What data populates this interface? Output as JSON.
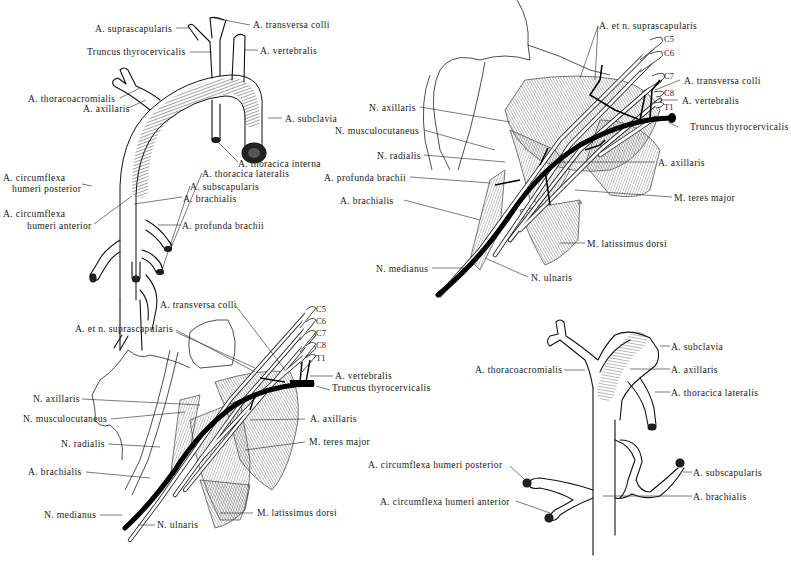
{
  "figures": {
    "fig_a": {
      "name": "arteria-subclavia-axillaris-schema",
      "labels": {
        "suprascapularis": "A. suprascapularis",
        "transversa_colli": "A. transversa colli",
        "truncus": "Truncus thyrocervicalis",
        "vertebralis": "A. vertebralis",
        "thoracoacromialis": "A. thoracoacromialis",
        "axillaris": "A. axillaris",
        "subclavia": "A. subclavia",
        "thoracica_interna": "A. thoracica interna",
        "thoracica_lateralis": "A. thoracica lateralis",
        "circ_post_1": "A. circumflexa",
        "circ_post_2": "humeri posterior",
        "subscapularis": "A. subscapularis",
        "circ_ant_1": "A. circumflexa",
        "circ_ant_2": "humeri anterior",
        "brachialis": "A. brachialis",
        "profunda": "A. profunda brachii"
      }
    },
    "fig_b": {
      "name": "plexus-brachialis-axilla-right",
      "labels": {
        "supra": "A. et n. suprascapularis",
        "c5": "C5",
        "c6": "C6",
        "c7": "C7",
        "c8": "C8",
        "t1": "T1",
        "transversa_colli": "A. transversa colli",
        "vertebralis": "A. vertebralis",
        "truncus": "Truncus thyrocervicalis",
        "n_axillaris": "N. axillaris",
        "n_musculo": "N. musculocutaneus",
        "n_radialis": "N. radialis",
        "profunda": "A. profunda brachii",
        "a_axillaris": "A. axillaris",
        "teres": "M. teres major",
        "brachialis": "A. brachialis",
        "latissimus": "M. latissimus dorsi",
        "n_medianus": "N. medianus",
        "n_ulnaris": "N. ulnaris"
      }
    },
    "fig_c": {
      "name": "plexus-brachialis-axilla-variant",
      "labels": {
        "transversa_colli": "A. transversa colli",
        "supra": "A. et n. suprascapularis",
        "c5": "C5",
        "c6": "C6",
        "c7": "C7",
        "c8": "C8",
        "t1": "T1",
        "vertebralis": "A. vertebralis",
        "truncus": "Truncus thyrocervicalis",
        "n_axillaris": "N. axillaris",
        "n_musculo": "N. musculocutaneus",
        "a_axillaris": "A. axillaris",
        "n_radialis": "N. radialis",
        "teres": "M. teres major",
        "brachialis": "A. brachialis",
        "n_medianus": "N. medianus",
        "latissimus": "M. latissimus dorsi",
        "n_ulnaris": "N. ulnaris"
      }
    },
    "fig_d": {
      "name": "arteria-axillaris-variant-schema",
      "labels": {
        "subclavia": "A. subclavia",
        "thoracoacromialis": "A. thoracoacromialis",
        "axillaris": "A. axillaris",
        "thoracica_lateralis": "A. thoracica lateralis",
        "circ_post": "A. circumflexa humeri posterior",
        "subscapularis": "A. subscapularis",
        "circ_ant": "A. circumflexa humeri anterior",
        "brachialis": "A. brachialis"
      }
    }
  },
  "colors": {
    "ink": "#111111",
    "paper": "#ffffff",
    "hatch": "#555555"
  }
}
